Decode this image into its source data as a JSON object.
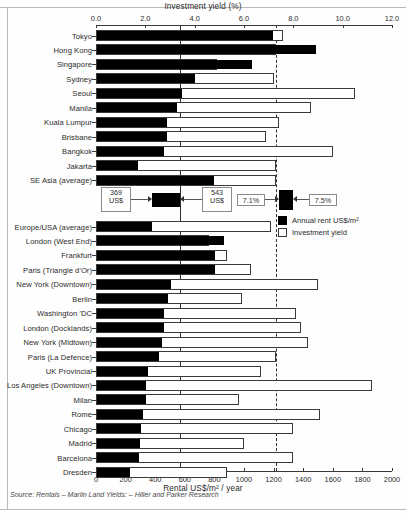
{
  "figure": {
    "top_axis_title": "Investment yield (%)",
    "bottom_axis_title": "Rental US$/m² / year",
    "source": "Source: Rentals – Marlin Land    Yields: – Hiller and Parker Research"
  },
  "legend": {
    "items": [
      {
        "label": "Annual rent US$/m²",
        "swatch": "filled",
        "color": "#000000"
      },
      {
        "label": "Investment yield",
        "swatch": "empty",
        "color": "#ffffff"
      }
    ]
  },
  "annotations": {
    "rent_low": {
      "value": "369",
      "unit": "US$"
    },
    "rent_high": {
      "value": "543",
      "unit": "US$"
    },
    "yield_low": "7.1%",
    "yield_high": "7.5%"
  },
  "chart_data": {
    "type": "bar",
    "title": "Investment yield (%)",
    "subtitle": "",
    "orientation": "horizontal",
    "grid": false,
    "legend_position": "right-middle",
    "xlabel_top": "Investment yield (%)",
    "xlabel_bottom": "Rental US$/m² / year",
    "ylabel": "",
    "top_axis": {
      "name": "Investment yield (%)",
      "ticks": [
        "0.0",
        "2.0",
        "4.0",
        "6.0",
        "8.0",
        "10.0",
        "12.0"
      ],
      "range": [
        0,
        12
      ]
    },
    "bottom_axis": {
      "name": "Rental US$/m² / year",
      "ticks": [
        "0",
        "200",
        "400",
        "600",
        "800",
        "1000",
        "1200",
        "1400",
        "1600",
        "1800",
        "2000"
      ],
      "range": [
        0,
        2000
      ]
    },
    "reference_lines": [
      {
        "value": 3.4,
        "axis": "top",
        "style": "solid"
      },
      {
        "value": 7.3,
        "axis": "top",
        "style": "dashed"
      }
    ],
    "series": [
      {
        "name": "Annual rent US$/m²",
        "axis": "bottom",
        "color": "#000000"
      },
      {
        "name": "Investment yield",
        "axis": "top",
        "color": "#ffffff"
      }
    ],
    "categories": [
      "Tokyo",
      "Hong Kong",
      "Singapore",
      "Sydney",
      "Seoul",
      "Manila",
      "Kuala Lumpur",
      "Brisbane",
      "Bangkok",
      "Jakarta",
      "SE Asia (average)",
      "Europe/USA (average)",
      "London (West End)",
      "Frankfurt",
      "Paris (Triangle d'Or)",
      "New York (Downtown)",
      "Berlin",
      "Washington 'DC",
      "London (Docklands)",
      "New York (Midtown)",
      "Paris (La Defence)",
      "UK Provincial",
      "Los Angeles (Downtown)",
      "Milan",
      "Rome",
      "Chicago",
      "Madrid",
      "Barcelona",
      "Dresden"
    ],
    "rows": [
      {
        "label": "Tokyo",
        "rent": 1190,
        "yield": 7.6,
        "group": "asia"
      },
      {
        "label": "Hong Kong",
        "rent": 1480,
        "yield": 7.3,
        "group": "asia"
      },
      {
        "label": "Singapore",
        "rent": 1050,
        "yield": 4.9,
        "group": "asia"
      },
      {
        "label": "Sydney",
        "rent": 660,
        "yield": 7.2,
        "group": "asia"
      },
      {
        "label": "Seoul",
        "rent": 575,
        "yield": 10.5,
        "group": "asia"
      },
      {
        "label": "Manila",
        "rent": 540,
        "yield": 8.7,
        "group": "asia"
      },
      {
        "label": "Kuala Lumpur",
        "rent": 470,
        "yield": 7.4,
        "group": "asia"
      },
      {
        "label": "Brisbane",
        "rent": 470,
        "yield": 6.9,
        "group": "asia"
      },
      {
        "label": "Bangkok",
        "rent": 450,
        "yield": 9.6,
        "group": "asia"
      },
      {
        "label": "Jakarta",
        "rent": 280,
        "yield": 7.3,
        "group": "asia"
      },
      {
        "label": "SE Asia (average)",
        "rent": 790,
        "yield": 7.3,
        "group": "asia"
      },
      {
        "label": "Europe/USA (average)",
        "rent": 369,
        "yield": 7.1,
        "group": "euro"
      },
      {
        "label": "London (West End)",
        "rent": 855,
        "yield": 4.6,
        "group": "euro"
      },
      {
        "label": "Frankfurt",
        "rent": 800,
        "yield": 5.3,
        "group": "euro"
      },
      {
        "label": "Paris (Triangle d'Or)",
        "rent": 800,
        "yield": 6.3,
        "group": "euro"
      },
      {
        "label": "New York (Downtown)",
        "rent": 500,
        "yield": 9.0,
        "group": "euro"
      },
      {
        "label": "Berlin",
        "rent": 480,
        "yield": 5.9,
        "group": "euro"
      },
      {
        "label": "Washington 'DC",
        "rent": 455,
        "yield": 8.1,
        "group": "euro"
      },
      {
        "label": "London (Docklands)",
        "rent": 450,
        "yield": 8.3,
        "group": "euro"
      },
      {
        "label": "New York (Midtown)",
        "rent": 440,
        "yield": 8.6,
        "group": "euro"
      },
      {
        "label": "Paris (La Defence)",
        "rent": 420,
        "yield": 7.3,
        "group": "euro"
      },
      {
        "label": "UK Provincial",
        "rent": 345,
        "yield": 6.7,
        "group": "euro"
      },
      {
        "label": "Los Angeles (Downtown)",
        "rent": 330,
        "yield": 11.2,
        "group": "euro"
      },
      {
        "label": "Milan",
        "rent": 330,
        "yield": 5.8,
        "group": "euro"
      },
      {
        "label": "Rome",
        "rent": 310,
        "yield": 9.1,
        "group": "euro"
      },
      {
        "label": "Chicago",
        "rent": 295,
        "yield": 8.0,
        "group": "euro"
      },
      {
        "label": "Madrid",
        "rent": 290,
        "yield": 6.0,
        "group": "euro"
      },
      {
        "label": "Barcelona",
        "rent": 285,
        "yield": 8.0,
        "group": "euro"
      },
      {
        "label": "Dresden",
        "rent": 225,
        "yield": 5.3,
        "group": "euro"
      }
    ]
  }
}
